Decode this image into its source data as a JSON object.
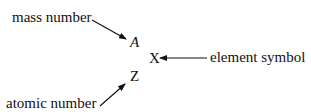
{
  "diagram": {
    "labels": {
      "mass_number": "mass number",
      "element_symbol": "element symbol",
      "atomic_number": "atomic number"
    },
    "symbols": {
      "mass": "A",
      "element": "X",
      "atomic": "Z"
    },
    "arrow_color": "#111111"
  }
}
